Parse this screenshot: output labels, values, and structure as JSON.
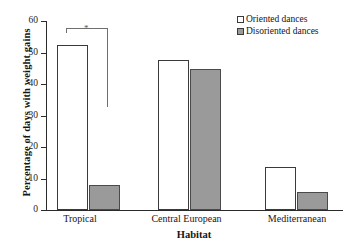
{
  "chart_data": {
    "type": "bar",
    "title": "",
    "xlabel": "Habitat",
    "ylabel": "Percentage of days with weight gains",
    "categories": [
      "Tropical",
      "Central European",
      "Mediterranean"
    ],
    "series": [
      {
        "name": "Oriented dances",
        "values": [
          52.5,
          47.5,
          13.5
        ],
        "color": "#ffffff"
      },
      {
        "name": "Disoriented dances",
        "values": [
          8.0,
          44.8,
          5.8
        ],
        "color": "#9a9a9a"
      }
    ],
    "ylim": [
      0,
      60
    ],
    "yticks": [
      0,
      10,
      20,
      30,
      40,
      50,
      60
    ],
    "ytick_labels": [
      "0",
      "10",
      "20",
      "30",
      "40",
      "50",
      "60"
    ],
    "grid": false,
    "legend_position": "top-right",
    "annotations": [
      {
        "type": "significance-bracket",
        "group": "Tropical",
        "label": "*",
        "between": [
          "Oriented dances",
          "Disoriented dances"
        ]
      }
    ]
  },
  "legend": {
    "items": [
      {
        "label": "Oriented dances",
        "swatch": "open-square"
      },
      {
        "label": "Disoriented dances",
        "swatch": "filled-square"
      }
    ]
  },
  "axes": {
    "y_title": "Percentage of days with weight gains",
    "x_title": "Habitat",
    "y_tick_labels": [
      "60",
      "50",
      "40",
      "30",
      "20",
      "10",
      "0"
    ],
    "x_tick_labels": [
      "Tropical",
      "Central European",
      "Mediterranean"
    ]
  },
  "annotation": {
    "asterisk": "*"
  }
}
